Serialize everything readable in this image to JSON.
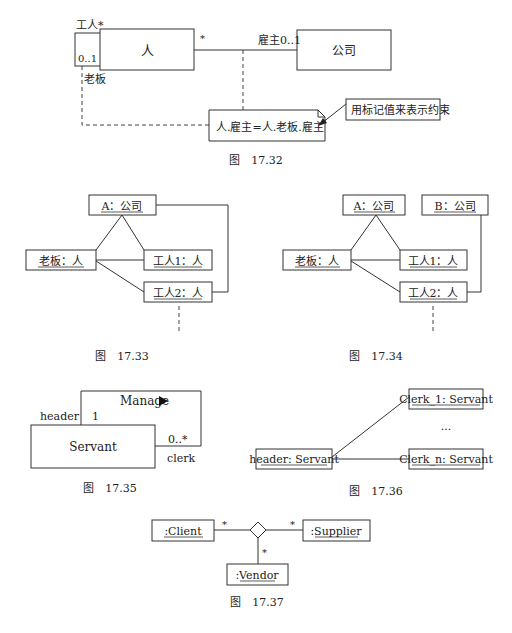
{
  "fig_17_32": {
    "caption": "图　17.32",
    "class_person": "人",
    "class_company": "公司",
    "self_assoc_top_label": "工人*",
    "self_assoc_mult": "0..1",
    "self_assoc_role": "老板",
    "person_end_mult": "*",
    "company_end_label": "雇主0..1",
    "constraint": "人.雇主=人.老板.雇主",
    "note": "用标记值来表示约束"
  },
  "fig_17_33": {
    "caption": "图　17.33",
    "objects": [
      "A：公司",
      "老板：人",
      "工人1：人",
      "工人2：人"
    ]
  },
  "fig_17_34": {
    "caption": "图　17.34",
    "objects": [
      "A：公司",
      "B：公司",
      "老板：人",
      "工人1：人",
      "工人2：人"
    ]
  },
  "fig_17_35": {
    "caption": "图　17.35",
    "class_name": "Servant",
    "assoc_name": "Manage",
    "assoc_direction_icon": "triangle-right",
    "role_header": "header",
    "mult_header": "1",
    "role_clerk": "clerk",
    "mult_clerk": "0..*"
  },
  "fig_17_36": {
    "caption": "图　17.36",
    "header_obj": "header: Servant",
    "clerk_1": "Clerk_1: Servant",
    "ellipsis": "...",
    "clerk_n": "Clerk_n: Servant"
  },
  "fig_17_37": {
    "caption": "图　17.37",
    "client": ":Client",
    "supplier": ":Supplier",
    "vendor": ":Vendor",
    "mult_client": "*",
    "mult_supplier": "*",
    "mult_vendor": "*"
  }
}
